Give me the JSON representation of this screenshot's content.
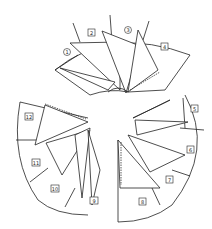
{
  "diagram": {
    "title": "",
    "groups": [
      {
        "name": "top-fan",
        "panels": [
          "1",
          "2",
          "3",
          "4"
        ]
      },
      {
        "name": "right-fan",
        "panels": [
          "5",
          "6",
          "7",
          "8"
        ]
      },
      {
        "name": "left-fan",
        "panels": [
          "9",
          "10",
          "11",
          "12"
        ]
      }
    ],
    "labels": {
      "p1": "1",
      "p2": "2",
      "p3": "3",
      "p4": "4",
      "p5": "5",
      "p6": "6",
      "p7": "7",
      "p8": "8",
      "p9": "9",
      "p10": "10",
      "p11": "11",
      "p12": "12"
    },
    "colors": {
      "stroke": "#222222",
      "background": "#ffffff"
    }
  }
}
